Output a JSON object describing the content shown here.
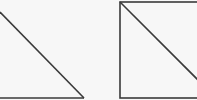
{
  "diagram": {
    "shapes": [
      {
        "kind": "right-triangle",
        "description": "triangle with hypotenuse from top-left to bottom-right and horizontal base",
        "stroke_color": "#3a3a3a"
      },
      {
        "kind": "square-with-diagonal",
        "description": "square split by a diagonal from top-left to bottom-right",
        "stroke_color": "#3a3a3a"
      }
    ],
    "background_color": "#f7f7f7"
  }
}
